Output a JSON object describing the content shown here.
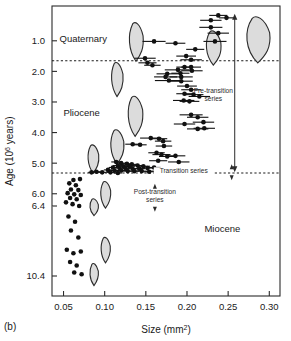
{
  "panel_label": "(b)",
  "chart_data": {
    "type": "scatter",
    "title": "",
    "xlabel": "Size (mm2)",
    "xlabel_base": "Size (mm",
    "xlabel_sup": "2",
    "xlabel_tail": ")",
    "ylabel_base": "Age (10",
    "ylabel_sup": "6",
    "ylabel_tail": " years)",
    "ylabel": "Age (106 years)",
    "xlim": [
      0.036,
      0.313
    ],
    "xticks": [
      0.05,
      0.1,
      0.15,
      0.2,
      0.25,
      0.3
    ],
    "xticklabels": [
      "0.05",
      "0.10",
      "0.15",
      "0.20",
      "0.25",
      "0.30"
    ],
    "yticks": [
      1.0,
      2.0,
      3.0,
      4.0,
      5.0,
      6.0,
      6.4,
      10.4
    ],
    "yticklabels": [
      "1.0",
      "2.0",
      "3.0",
      "4.0",
      "5.0",
      "6.0",
      "6.4",
      "10.4"
    ],
    "y_axis_note": "broken axis: linear 0-6.4 Ma, compressed gap, then 10.4 Ma",
    "ylim": [
      0.0,
      11.2
    ],
    "grid": false,
    "legend": false,
    "marker": "filled-circle-with-horizontal-error-bar",
    "annotations": [
      {
        "name": "quaternary",
        "text": "Quaternary",
        "x": 0.074,
        "y": 1.05
      },
      {
        "name": "pliocene",
        "text": "Pliocene",
        "x": 0.072,
        "y": 3.45
      },
      {
        "name": "miocene",
        "text": "Miocene",
        "x": 0.243,
        "y": 7.9
      },
      {
        "name": "pre-transition-series",
        "text_line1": "Pre-transition",
        "text_line2": "series",
        "x": 0.232,
        "y": 2.72
      },
      {
        "name": "transition-series",
        "text": "Transition series",
        "x": 0.196,
        "y": 5.33
      },
      {
        "name": "post-transition-series",
        "text_line1": "Post-transition",
        "text_line2": "series",
        "x": 0.161,
        "y": 6.0
      }
    ],
    "boundaries": [
      {
        "name": "pleistocene-pliocene-boundary",
        "age": 1.65,
        "style": "dotted"
      },
      {
        "name": "pliocene-miocene-boundary",
        "age": 5.32,
        "style": "dotted"
      }
    ],
    "series": [
      {
        "name": "Pre-transition series (with error bars)",
        "points": [
          {
            "x": 0.238,
            "y": 0.17,
            "xerr": 0.011
          },
          {
            "x": 0.229,
            "y": 0.33,
            "xerr": 0.013
          },
          {
            "x": 0.248,
            "y": 0.25,
            "xerr": 0.009
          },
          {
            "x": 0.229,
            "y": 0.56,
            "xerr": 0.014
          },
          {
            "x": 0.238,
            "y": 0.75,
            "xerr": 0.013
          },
          {
            "x": 0.16,
            "y": 1.02,
            "xerr": 0.014
          },
          {
            "x": 0.186,
            "y": 1.08,
            "xerr": 0.012
          },
          {
            "x": 0.234,
            "y": 1.02,
            "xerr": 0.014
          },
          {
            "x": 0.21,
            "y": 1.28,
            "xerr": 0.011
          },
          {
            "x": 0.199,
            "y": 1.5,
            "xerr": 0.012
          },
          {
            "x": 0.149,
            "y": 1.57,
            "xerr": 0.013
          },
          {
            "x": 0.205,
            "y": 1.62,
            "xerr": 0.013
          },
          {
            "x": 0.152,
            "y": 1.72,
            "xerr": 0.011
          },
          {
            "x": 0.158,
            "y": 1.8,
            "xerr": 0.01
          },
          {
            "x": 0.197,
            "y": 1.86,
            "xerr": 0.01
          },
          {
            "x": 0.205,
            "y": 1.86,
            "xerr": 0.012
          },
          {
            "x": 0.189,
            "y": 1.95,
            "xerr": 0.016
          },
          {
            "x": 0.206,
            "y": 1.98,
            "xerr": 0.013
          },
          {
            "x": 0.176,
            "y": 2.08,
            "xerr": 0.013
          },
          {
            "x": 0.192,
            "y": 2.06,
            "xerr": 0.011
          },
          {
            "x": 0.174,
            "y": 2.18,
            "xerr": 0.014
          },
          {
            "x": 0.193,
            "y": 2.18,
            "xerr": 0.014
          },
          {
            "x": 0.178,
            "y": 2.3,
            "xerr": 0.017
          },
          {
            "x": 0.193,
            "y": 2.32,
            "xerr": 0.014
          },
          {
            "x": 0.2,
            "y": 2.48,
            "xerr": 0.012
          },
          {
            "x": 0.205,
            "y": 2.6,
            "xerr": 0.012
          },
          {
            "x": 0.197,
            "y": 2.73,
            "xerr": 0.01
          },
          {
            "x": 0.208,
            "y": 2.76,
            "xerr": 0.012
          },
          {
            "x": 0.215,
            "y": 2.82,
            "xerr": 0.013
          },
          {
            "x": 0.196,
            "y": 2.95,
            "xerr": 0.013
          },
          {
            "x": 0.203,
            "y": 2.98,
            "xerr": 0.012
          },
          {
            "x": 0.205,
            "y": 3.42,
            "xerr": 0.014
          },
          {
            "x": 0.213,
            "y": 3.5,
            "xerr": 0.013
          },
          {
            "x": 0.197,
            "y": 3.72,
            "xerr": 0.013
          },
          {
            "x": 0.22,
            "y": 3.66,
            "xerr": 0.013
          },
          {
            "x": 0.213,
            "y": 3.88,
            "xerr": 0.013
          },
          {
            "x": 0.221,
            "y": 3.86,
            "xerr": 0.013
          },
          {
            "x": 0.156,
            "y": 4.18,
            "xerr": 0.013
          },
          {
            "x": 0.166,
            "y": 4.2,
            "xerr": 0.01
          },
          {
            "x": 0.171,
            "y": 4.28,
            "xerr": 0.01
          },
          {
            "x": 0.134,
            "y": 4.38,
            "xerr": 0.009
          },
          {
            "x": 0.143,
            "y": 4.4,
            "xerr": 0.008
          },
          {
            "x": 0.172,
            "y": 4.44,
            "xerr": 0.01
          },
          {
            "x": 0.163,
            "y": 4.66,
            "xerr": 0.01
          },
          {
            "x": 0.169,
            "y": 4.72,
            "xerr": 0.011
          },
          {
            "x": 0.176,
            "y": 4.78,
            "xerr": 0.01
          },
          {
            "x": 0.186,
            "y": 4.76,
            "xerr": 0.012
          },
          {
            "x": 0.165,
            "y": 4.92,
            "xerr": 0.011
          },
          {
            "x": 0.19,
            "y": 4.96,
            "xerr": 0.013
          }
        ]
      },
      {
        "name": "Transition series cluster",
        "points": [
          {
            "x": 0.114,
            "y": 4.96,
            "xerr": 0.006
          },
          {
            "x": 0.12,
            "y": 5.0,
            "xerr": 0.006
          },
          {
            "x": 0.127,
            "y": 5.02,
            "xerr": 0.007
          },
          {
            "x": 0.133,
            "y": 5.04,
            "xerr": 0.007
          },
          {
            "x": 0.116,
            "y": 5.08,
            "xerr": 0.006
          },
          {
            "x": 0.123,
            "y": 5.1,
            "xerr": 0.006
          },
          {
            "x": 0.13,
            "y": 5.1,
            "xerr": 0.007
          },
          {
            "x": 0.14,
            "y": 5.08,
            "xerr": 0.008
          },
          {
            "x": 0.147,
            "y": 5.1,
            "xerr": 0.008
          },
          {
            "x": 0.11,
            "y": 5.14,
            "xerr": 0.005
          },
          {
            "x": 0.118,
            "y": 5.16,
            "xerr": 0.006
          },
          {
            "x": 0.125,
            "y": 5.16,
            "xerr": 0.006
          },
          {
            "x": 0.134,
            "y": 5.18,
            "xerr": 0.007
          },
          {
            "x": 0.142,
            "y": 5.18,
            "xerr": 0.007
          },
          {
            "x": 0.152,
            "y": 5.16,
            "xerr": 0.008
          },
          {
            "x": 0.16,
            "y": 5.14,
            "xerr": 0.008
          },
          {
            "x": 0.104,
            "y": 5.22,
            "xerr": 0.005
          },
          {
            "x": 0.112,
            "y": 5.24,
            "xerr": 0.005
          },
          {
            "x": 0.12,
            "y": 5.24,
            "xerr": 0.006
          },
          {
            "x": 0.128,
            "y": 5.26,
            "xerr": 0.006
          },
          {
            "x": 0.136,
            "y": 5.26,
            "xerr": 0.006
          },
          {
            "x": 0.145,
            "y": 5.26,
            "xerr": 0.007
          },
          {
            "x": 0.154,
            "y": 5.28,
            "xerr": 0.007
          },
          {
            "x": 0.163,
            "y": 5.26,
            "xerr": 0.008
          },
          {
            "x": 0.09,
            "y": 5.28,
            "xerr": 0.005
          },
          {
            "x": 0.097,
            "y": 5.3,
            "xerr": 0.005
          },
          {
            "x": 0.084,
            "y": 5.3,
            "xerr": 0.004
          },
          {
            "x": 0.107,
            "y": 5.3,
            "xerr": 0.005
          },
          {
            "x": 0.116,
            "y": 5.32,
            "xerr": 0.005
          }
        ]
      },
      {
        "name": "Post-transition series (no error bars)",
        "points": [
          {
            "x": 0.062,
            "y": 5.55
          },
          {
            "x": 0.07,
            "y": 5.52
          },
          {
            "x": 0.057,
            "y": 5.66
          },
          {
            "x": 0.065,
            "y": 5.72
          },
          {
            "x": 0.059,
            "y": 5.86
          },
          {
            "x": 0.068,
            "y": 5.88
          },
          {
            "x": 0.055,
            "y": 5.98
          },
          {
            "x": 0.063,
            "y": 6.02
          },
          {
            "x": 0.071,
            "y": 6.04
          },
          {
            "x": 0.058,
            "y": 6.14
          },
          {
            "x": 0.066,
            "y": 6.18
          },
          {
            "x": 0.053,
            "y": 6.28
          },
          {
            "x": 0.061,
            "y": 6.34
          },
          {
            "x": 0.069,
            "y": 6.4
          },
          {
            "x": 0.056,
            "y": 7.0
          },
          {
            "x": 0.064,
            "y": 7.3
          },
          {
            "x": 0.059,
            "y": 7.8
          },
          {
            "x": 0.068,
            "y": 8.2
          },
          {
            "x": 0.054,
            "y": 8.9
          },
          {
            "x": 0.062,
            "y": 9.1
          },
          {
            "x": 0.071,
            "y": 9.0
          },
          {
            "x": 0.058,
            "y": 9.6
          },
          {
            "x": 0.066,
            "y": 9.8
          },
          {
            "x": 0.063,
            "y": 10.2
          },
          {
            "x": 0.072,
            "y": 10.3
          }
        ]
      }
    ],
    "shell_outlines": [
      {
        "name": "shell-quaternary-large",
        "x": 0.286,
        "y": 0.95,
        "w": 0.03,
        "h": 1.55
      },
      {
        "name": "shell-quaternary-mid",
        "x": 0.232,
        "y": 1.22,
        "w": 0.019,
        "h": 1.15
      },
      {
        "name": "shell-quaternary-small",
        "x": 0.138,
        "y": 1.02,
        "w": 0.018,
        "h": 1.3
      },
      {
        "name": "shell-pliocene-upper",
        "x": 0.115,
        "y": 2.25,
        "w": 0.015,
        "h": 1.15
      },
      {
        "name": "shell-pliocene-mid",
        "x": 0.137,
        "y": 3.45,
        "w": 0.019,
        "h": 1.35
      },
      {
        "name": "shell-pliocene-low",
        "x": 0.115,
        "y": 4.45,
        "w": 0.017,
        "h": 1.15
      },
      {
        "name": "shell-pliocene-left",
        "x": 0.086,
        "y": 4.85,
        "w": 0.014,
        "h": 0.95
      },
      {
        "name": "shell-miocene-a",
        "x": 0.101,
        "y": 6.05,
        "w": 0.013,
        "h": 0.95
      },
      {
        "name": "shell-miocene-b",
        "x": 0.087,
        "y": 6.55,
        "w": 0.011,
        "h": 0.8
      },
      {
        "name": "shell-miocene-c",
        "x": 0.101,
        "y": 8.9,
        "w": 0.012,
        "h": 1.5
      },
      {
        "name": "shell-miocene-d",
        "x": 0.087,
        "y": 10.3,
        "w": 0.011,
        "h": 1.3
      }
    ],
    "span_arrow": {
      "name": "pre-transition-span-arrow",
      "x": 0.258,
      "y_top": 0.12,
      "y_bottom": 5.3,
      "double_headed": true
    }
  }
}
